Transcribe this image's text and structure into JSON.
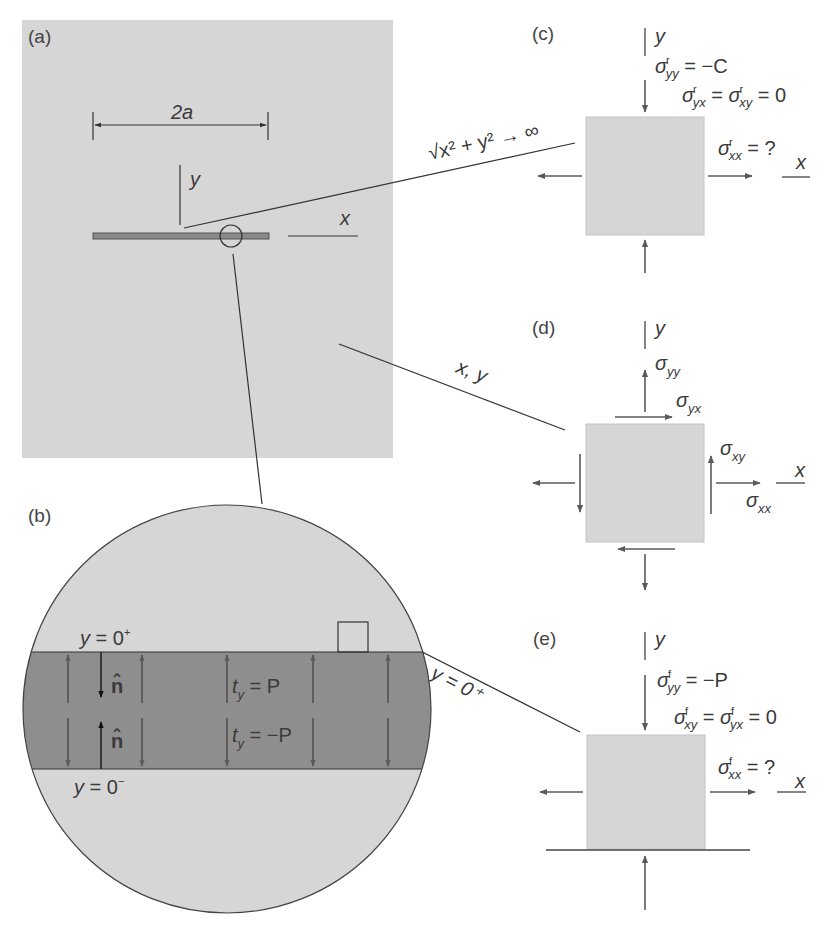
{
  "figure": {
    "colors": {
      "panel_fill": "#d6d6d6",
      "crack_band": "#8e8e8e",
      "arrow": "#5a5a5a",
      "line": "#3a3a3a",
      "normal_arrow": "#111111"
    },
    "panel_a": {
      "letter": "(a)",
      "dimension_label": "2a",
      "axis_y": "y",
      "axis_x": "x"
    },
    "panel_b": {
      "letter": "(b)",
      "upper_face": {
        "var": "y",
        "eq": " = 0",
        "sup": "+"
      },
      "lower_face": {
        "var": "y",
        "eq": " = 0",
        "sup": "−"
      },
      "normal_label": "n̂",
      "traction_top": {
        "t": "t",
        "sub": "y",
        "rhs": " = P"
      },
      "traction_bottom": {
        "t": "t",
        "sub": "y",
        "rhs": " = −P"
      }
    },
    "panel_c": {
      "letter": "(c)",
      "leader_label": "√x² + y² → ∞",
      "axis_y": "y",
      "axis_x": "x",
      "eq1": {
        "sym": "σ",
        "sup": "r",
        "sub": "yy",
        "rhs": " = −C"
      },
      "eq2": {
        "sym1": "σ",
        "sup1": "r",
        "sub1": "yx",
        "mid": " = ",
        "sym2": "σ",
        "sup2": "r",
        "sub2": "xy",
        "rhs": " = 0"
      },
      "eq3": {
        "sym": "σ",
        "sup": "r",
        "sub": "xx",
        "rhs": " = ?"
      }
    },
    "panel_d": {
      "letter": "(d)",
      "leader_label": "x, y",
      "axis_y": "y",
      "axis_x": "x",
      "syy": {
        "sym": "σ",
        "sub": "yy"
      },
      "syx": {
        "sym": "σ",
        "sub": "yx"
      },
      "sxy": {
        "sym": "σ",
        "sub": "xy"
      },
      "sxx": {
        "sym": "σ",
        "sub": "xx"
      }
    },
    "panel_e": {
      "letter": "(e)",
      "leader_label": "|x| ≤ a, y = 0⁺",
      "axis_y": "y",
      "axis_x": "x",
      "eq1": {
        "sym": "σ",
        "sup": "f",
        "sub": "yy",
        "rhs": " = −P"
      },
      "eq2": {
        "sym1": "σ",
        "sup1": "f",
        "sub1": "xy",
        "mid": " = ",
        "sym2": "σ",
        "sup2": "f",
        "sub2": "yx",
        "rhs": " = 0"
      },
      "eq3": {
        "sym": "σ",
        "sup": "f",
        "sub": "xx",
        "rhs": " = ?"
      }
    }
  }
}
